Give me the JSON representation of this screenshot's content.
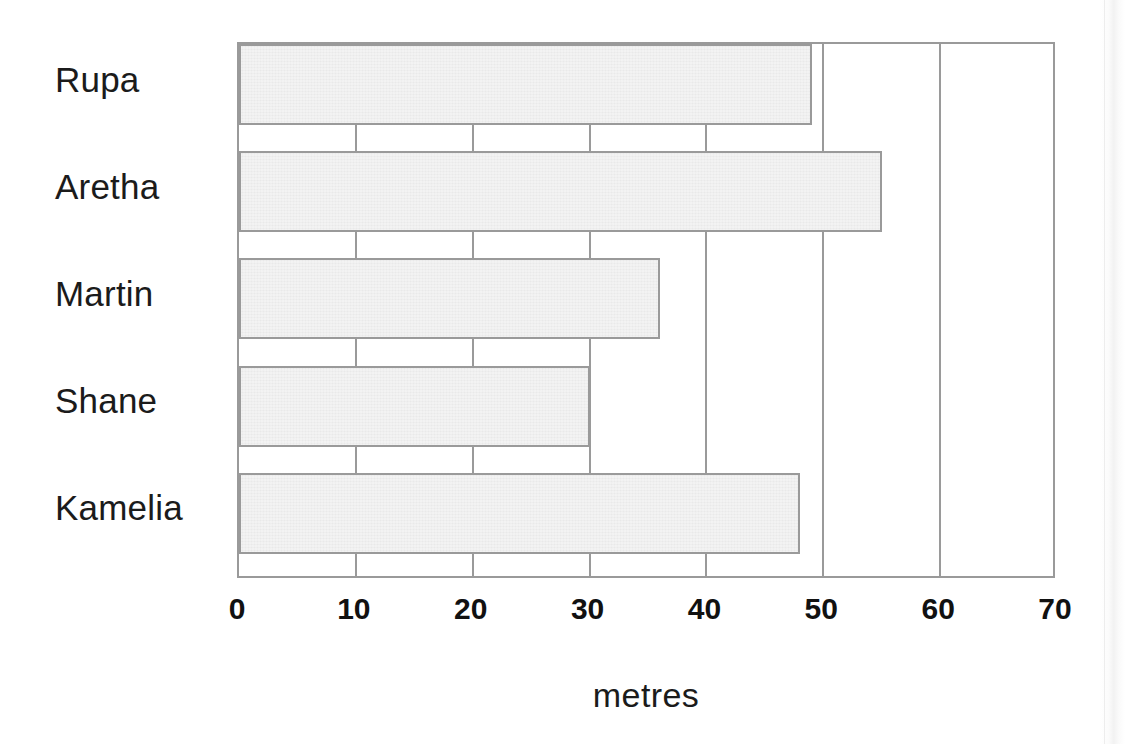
{
  "chart_data": {
    "type": "bar",
    "orientation": "horizontal",
    "title": "",
    "subtitle": "",
    "xlabel": "metres",
    "ylabel": "",
    "categories": [
      "Rupa",
      "Aretha",
      "Martin",
      "Shane",
      "Kamelia"
    ],
    "values": [
      49,
      55,
      36,
      30,
      48
    ],
    "xlim": [
      0,
      70
    ],
    "xticks": [
      0,
      10,
      20,
      30,
      40,
      50,
      60,
      70
    ],
    "xtick_labels": [
      "0",
      "10",
      "20",
      "30",
      "40",
      "50",
      "60",
      "70"
    ],
    "grid": true,
    "grid_axis": "x",
    "legend": false,
    "legend_position": "none",
    "annotations": [],
    "series": [
      {
        "name": "distance",
        "values": [
          49,
          55,
          36,
          30,
          48
        ]
      }
    ]
  },
  "axis": {
    "x_title": "metres",
    "ticks": [
      {
        "label": "0",
        "value": 0
      },
      {
        "label": "10",
        "value": 10
      },
      {
        "label": "20",
        "value": 20
      },
      {
        "label": "30",
        "value": 30
      },
      {
        "label": "40",
        "value": 40
      },
      {
        "label": "50",
        "value": 50
      },
      {
        "label": "60",
        "value": 60
      },
      {
        "label": "70",
        "value": 70
      }
    ]
  },
  "categories": [
    {
      "label": "Rupa",
      "value": 49
    },
    {
      "label": "Aretha",
      "value": 55
    },
    {
      "label": "Martin",
      "value": 36
    },
    {
      "label": "Shane",
      "value": 30
    },
    {
      "label": "Kamelia",
      "value": 48
    }
  ],
  "colors": {
    "bar_fill": "#e9e9e9",
    "bar_border": "#9a9a9a",
    "grid": "#9a9a9a",
    "text": "#1b1b1b",
    "background": "#ffffff"
  }
}
